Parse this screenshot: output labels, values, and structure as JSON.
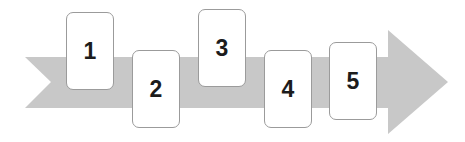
{
  "diagram": {
    "type": "process-arrow-steps",
    "title": "",
    "canvas": {
      "width": 465,
      "height": 142,
      "background": "#ffffff"
    },
    "arrow": {
      "name": "process-arrow",
      "fill": "#c8c8c8",
      "direction": "right",
      "body": {
        "x": 25,
        "y": 57,
        "width": 363,
        "height": 51
      },
      "tail_notch": {
        "depth": 26
      },
      "head": {
        "x": 388,
        "y": 30,
        "width": 60,
        "height": 104,
        "tip_x": 448,
        "tip_y": 82
      }
    },
    "steps": [
      {
        "label": "1",
        "x": 66,
        "y": 12,
        "width": 48,
        "height": 78
      },
      {
        "label": "2",
        "x": 132,
        "y": 50,
        "width": 48,
        "height": 78
      },
      {
        "label": "3",
        "x": 198,
        "y": 9,
        "width": 48,
        "height": 78
      },
      {
        "label": "4",
        "x": 264,
        "y": 50,
        "width": 48,
        "height": 78
      },
      {
        "label": "5",
        "x": 329,
        "y": 42,
        "width": 48,
        "height": 78
      }
    ],
    "colors": {
      "arrow_fill": "#c8c8c8",
      "card_fill": "#ffffff",
      "card_border": "#9b9b9b",
      "label_text": "#1c1c1c",
      "background": "#ffffff"
    }
  }
}
